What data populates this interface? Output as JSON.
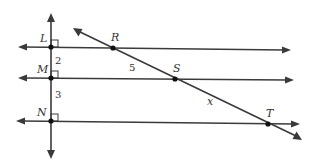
{
  "diagram": {
    "points": {
      "L": {
        "label": "L",
        "x": 51,
        "y": 47
      },
      "M": {
        "label": "M",
        "x": 51,
        "y": 78
      },
      "N": {
        "label": "N",
        "x": 51,
        "y": 121
      },
      "R": {
        "label": "R",
        "x": 113,
        "y": 48
      },
      "S": {
        "label": "S",
        "x": 175,
        "y": 79
      },
      "T": {
        "label": "T",
        "x": 268,
        "y": 124
      }
    },
    "segment_labels": {
      "LM": "2",
      "MN": "3",
      "RS": "5",
      "ST": "x"
    },
    "colors": {
      "line": "#3a3a3a",
      "text": "#333333",
      "background": "#ffffff"
    }
  }
}
